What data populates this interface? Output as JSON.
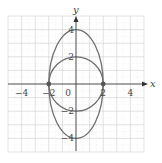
{
  "chart_data": {
    "type": "line",
    "title": "",
    "xlabel": "x",
    "ylabel": "y",
    "xlim": [
      -5,
      5
    ],
    "ylim": [
      -5,
      5
    ],
    "grid": true,
    "x_ticks": [
      -4,
      -2,
      0,
      2,
      4
    ],
    "x_tick_labels": [
      "-4",
      "-2",
      "0",
      "2",
      "4"
    ],
    "y_ticks": [
      4,
      2,
      -2,
      -4
    ],
    "y_tick_labels": [
      "4",
      "2",
      "-2",
      "-4"
    ],
    "series": [
      {
        "name": "circle",
        "equation": "x^2 + y^2 = 4",
        "shape": "ellipse",
        "center": [
          0,
          0
        ],
        "rx": 2,
        "ry": 2
      },
      {
        "name": "ellipse",
        "equation": "x^2/4 + y^2/16 = 1",
        "shape": "ellipse",
        "center": [
          0,
          0
        ],
        "rx": 2,
        "ry": 4
      }
    ],
    "points": [
      {
        "x": -2,
        "y": 0,
        "label": "intersection"
      },
      {
        "x": 2,
        "y": 0,
        "label": "intersection"
      }
    ],
    "colors": {
      "curve": "#6e6e6e",
      "axis": "#333333",
      "grid_major": "#d4d4d4",
      "grid_minor": "#ececec",
      "point": "#555555"
    }
  }
}
